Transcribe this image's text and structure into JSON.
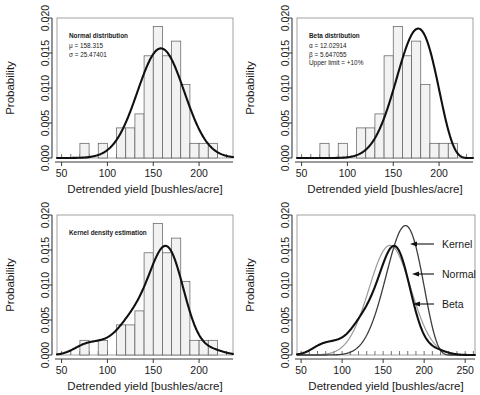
{
  "figure": {
    "panels": [
      {
        "id": "normal",
        "annotation_title": "Normal distribution",
        "annotation_lines": [
          "μ = 158.315",
          "σ = 25.47401"
        ],
        "xlabel": "Detrended yield [bushles/acre]",
        "ylabel": "Probability"
      },
      {
        "id": "beta",
        "annotation_title": "Beta distribution",
        "annotation_lines": [
          "α = 12.02914",
          "β = 5.647055",
          "Upper limit = +10%"
        ],
        "xlabel": "Detrended yield [bushles/acre]",
        "ylabel": "Probability"
      },
      {
        "id": "kernel",
        "annotation_title": "Kernel density estimation",
        "annotation_lines": [],
        "xlabel": "Detrended yield [bushles/acre]",
        "ylabel": "Probability"
      },
      {
        "id": "comparison",
        "annotation_title": "",
        "annotation_lines": [],
        "curve_labels": [
          "Kernel",
          "Normal",
          "Beta"
        ],
        "xlabel": "Detrended yield [bushles/acre]",
        "ylabel": "Probability"
      }
    ]
  },
  "chart_data": [
    {
      "type": "bar",
      "id": "normal",
      "title": "Normal distribution",
      "xlabel": "Detrended yield [bushles/acre]",
      "ylabel": "Probability",
      "xlim": [
        45,
        237
      ],
      "ylim": [
        0,
        0.02
      ],
      "xticks": [
        50,
        100,
        150,
        200
      ],
      "yticks": [
        0.0,
        0.005,
        0.01,
        0.015,
        0.02
      ],
      "ytick_labels": [
        "0.000",
        "0.005",
        "0.010",
        "0.015",
        "0.020"
      ],
      "grid": false,
      "annotations": [
        {
          "text": "Normal distribution",
          "bold": true
        },
        {
          "text": "μ = 158.315"
        },
        {
          "text": "σ = 25.47401"
        }
      ],
      "histogram": {
        "bin_width": 10,
        "bin_starts": [
          70,
          80,
          90,
          100,
          110,
          120,
          130,
          140,
          150,
          160,
          170,
          180,
          190,
          200,
          210
        ],
        "values": [
          0.0021,
          0.0,
          0.0021,
          0.0,
          0.0043,
          0.0043,
          0.0063,
          0.0146,
          0.0188,
          0.0146,
          0.0167,
          0.0105,
          0.0021,
          0.0021,
          0.0021
        ]
      },
      "series": [
        {
          "name": "Normal density",
          "kind": "line",
          "mu": 158.315,
          "sigma": 25.47401,
          "peak": 0.01566
        }
      ]
    },
    {
      "type": "bar",
      "id": "beta",
      "title": "Beta distribution",
      "xlabel": "Detrended yield [bushles/acre]",
      "ylabel": "Probability",
      "xlim": [
        45,
        237
      ],
      "ylim": [
        0,
        0.02
      ],
      "xticks": [
        50,
        100,
        150,
        200
      ],
      "yticks": [
        0.0,
        0.005,
        0.01,
        0.015,
        0.02
      ],
      "ytick_labels": [
        "0.000",
        "0.005",
        "0.010",
        "0.015",
        "0.020"
      ],
      "grid": false,
      "annotations": [
        {
          "text": "Beta distribution",
          "bold": true
        },
        {
          "text": "α = 12.02914"
        },
        {
          "text": "β = 5.647055"
        },
        {
          "text": "Upper limit = +10%"
        }
      ],
      "histogram": {
        "bin_width": 10,
        "bin_starts": [
          70,
          80,
          90,
          100,
          110,
          120,
          130,
          140,
          150,
          160,
          170,
          180,
          190,
          200,
          210
        ],
        "values": [
          0.0021,
          0.0,
          0.0021,
          0.0,
          0.0043,
          0.0043,
          0.0063,
          0.0146,
          0.0188,
          0.0146,
          0.0167,
          0.0105,
          0.0021,
          0.0021,
          0.0021
        ]
      },
      "series": [
        {
          "name": "Beta density",
          "kind": "line",
          "alpha": 12.02914,
          "beta": 5.647055,
          "upper_limit_pct": 10,
          "peak": 0.01555,
          "peak_x": 163
        }
      ]
    },
    {
      "type": "bar",
      "id": "kernel",
      "title": "Kernel density estimation",
      "xlabel": "Detrended yield [bushles/acre]",
      "ylabel": "Probability",
      "xlim": [
        45,
        237
      ],
      "ylim": [
        0,
        0.02
      ],
      "xticks": [
        50,
        100,
        150,
        200
      ],
      "yticks": [
        0.0,
        0.005,
        0.01,
        0.015,
        0.02
      ],
      "ytick_labels": [
        "0.000",
        "0.005",
        "0.010",
        "0.015",
        "0.020"
      ],
      "grid": false,
      "annotations": [
        {
          "text": "Kernel density estimation",
          "bold": true
        }
      ],
      "histogram": {
        "bin_width": 10,
        "bin_starts": [
          70,
          80,
          90,
          100,
          110,
          120,
          130,
          140,
          150,
          160,
          170,
          180,
          190,
          200,
          210
        ],
        "values": [
          0.0021,
          0.0,
          0.0021,
          0.0,
          0.0043,
          0.0043,
          0.0063,
          0.0146,
          0.0188,
          0.0146,
          0.0167,
          0.0105,
          0.0021,
          0.0021,
          0.0021
        ]
      },
      "series": [
        {
          "name": "Kernel density",
          "kind": "line",
          "peak": 0.01565,
          "peak_x": 162,
          "shoulder_x": 80,
          "shoulder_y": 0.0018
        }
      ]
    },
    {
      "type": "line",
      "id": "comparison",
      "title": "",
      "xlabel": "Detrended yield [bushles/acre]",
      "ylabel": "Probability",
      "xlim": [
        45,
        262
      ],
      "ylim": [
        0,
        0.02
      ],
      "xticks": [
        50,
        100,
        150,
        200,
        250
      ],
      "yticks": [
        0.0,
        0.005,
        0.01,
        0.015,
        0.02
      ],
      "ytick_labels": [
        "0.000",
        "0.005",
        "0.010",
        "0.015",
        "0.020"
      ],
      "grid": false,
      "legend_position": "inline-annotations",
      "series": [
        {
          "name": "Kernel",
          "peak": 0.01565,
          "peak_x": 162
        },
        {
          "name": "Normal",
          "peak": 0.01566,
          "peak_x": 158.315
        },
        {
          "name": "Beta",
          "peak": 0.01555,
          "peak_x": 163
        }
      ],
      "annotations": [
        {
          "text": "Kernel"
        },
        {
          "text": "Normal"
        },
        {
          "text": "Beta"
        }
      ]
    }
  ]
}
